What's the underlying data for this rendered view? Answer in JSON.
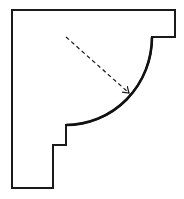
{
  "diagram": {
    "colors": {
      "stroke": "#1a1a1a",
      "background": "#ffffff"
    },
    "profile": {
      "outline_points": [
        [
          12,
          10
        ],
        [
          175,
          10
        ],
        [
          175,
          37
        ],
        [
          152,
          37
        ]
      ],
      "arc": {
        "from": [
          152,
          37
        ],
        "to": [
          66,
          125
        ],
        "center": [
          66,
          37
        ],
        "rx": 86,
        "ry": 88
      },
      "lower_points": [
        [
          66,
          125
        ],
        [
          66,
          145
        ],
        [
          53,
          145
        ],
        [
          53,
          188
        ],
        [
          12,
          188
        ],
        [
          12,
          10
        ]
      ]
    },
    "radius_arrow": {
      "from": [
        66,
        37
      ],
      "to": [
        129,
        93
      ],
      "style": "dashed"
    }
  }
}
